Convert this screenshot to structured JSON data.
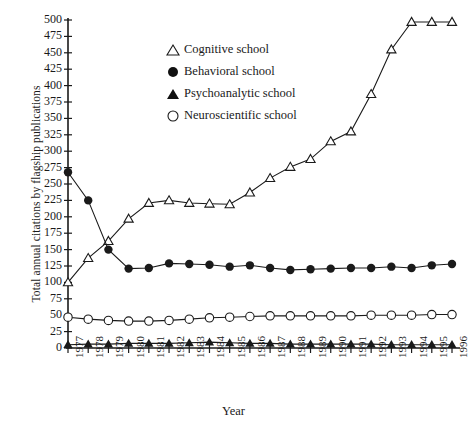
{
  "chart_data": {
    "type": "line",
    "title": "",
    "xlabel": "Year",
    "ylabel": "Total annual citations by flagship publications",
    "x": [
      1977,
      1978,
      1979,
      1980,
      1981,
      1982,
      1983,
      1984,
      1985,
      1986,
      1987,
      1988,
      1989,
      1990,
      1991,
      1992,
      1993,
      1994,
      1995,
      1996
    ],
    "xtick_labels": [
      "1977",
      "1978",
      "1979",
      "1980",
      "1981",
      "1982",
      "1983",
      "1984",
      "1985",
      "1986",
      "1987",
      "1988",
      "1989",
      "1990",
      "1991",
      "1992",
      "1993",
      "1994",
      "1995",
      "1996"
    ],
    "ytick_labels": [
      "0",
      "25",
      "50",
      "75",
      "100",
      "125",
      "150",
      "175",
      "200",
      "225",
      "250",
      "275",
      "300",
      "325",
      "350",
      "375",
      "400",
      "425",
      "450",
      "475",
      "500"
    ],
    "ylim": [
      0,
      500
    ],
    "ytick_step": 25,
    "xlim": [
      1977,
      1996
    ],
    "grid": false,
    "legend_position": "upper-left-inside",
    "series": [
      {
        "name": "Cognitive school",
        "marker": "open-triangle",
        "color": "#1a1a1a",
        "values": [
          100,
          137,
          163,
          197,
          221,
          225,
          221,
          220,
          219,
          237,
          259,
          276,
          288,
          315,
          330,
          387,
          455,
          497,
          497,
          497
        ]
      },
      {
        "name": "Behavioral school",
        "marker": "filled-circle",
        "color": "#1a1a1a",
        "values": [
          268,
          225,
          150,
          121,
          122,
          129,
          128,
          127,
          124,
          126,
          122,
          119,
          120,
          121,
          122,
          122,
          124,
          122,
          126,
          128
        ]
      },
      {
        "name": "Psychoanalytic school",
        "marker": "filled-triangle",
        "color": "#1a1a1a",
        "values": [
          5,
          6,
          6,
          7,
          7,
          7,
          8,
          9,
          8,
          7,
          7,
          6,
          6,
          6,
          6,
          6,
          5,
          5,
          5,
          5
        ]
      },
      {
        "name": "Neuroscientific school",
        "marker": "open-circle",
        "color": "#1a1a1a",
        "values": [
          47,
          44,
          42,
          41,
          41,
          42,
          44,
          46,
          47,
          48,
          49,
          49,
          49,
          49,
          49,
          50,
          50,
          50,
          51,
          51
        ]
      }
    ]
  },
  "legend": {
    "items": [
      {
        "marker": "open-triangle",
        "label": "Cognitive school"
      },
      {
        "marker": "filled-circle",
        "label": "Behavioral school"
      },
      {
        "marker": "filled-triangle",
        "label": "Psychoanalytic school"
      },
      {
        "marker": "open-circle",
        "label": "Neuroscientific school"
      }
    ]
  }
}
